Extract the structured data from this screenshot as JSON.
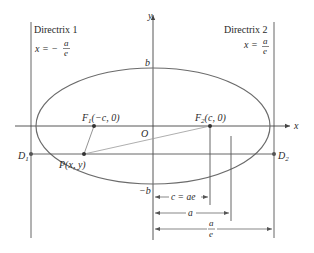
{
  "diagram": {
    "type": "ellipse-directrix",
    "colors": {
      "ellipse": "#6b6b6b",
      "axes": "#444444",
      "lines": "#555555",
      "text": "#2a2a2a"
    },
    "axes": {
      "x_label": "x",
      "y_label": "y",
      "origin_label": "O"
    },
    "ellipse": {
      "top_label": "b",
      "bottom_label": "−b"
    },
    "directrix1": {
      "title": "Directrix 1",
      "eq_lhs": "x = −",
      "eq_num": "a",
      "eq_den": "e"
    },
    "directrix2": {
      "title": "Directrix 2",
      "eq_lhs": "x =",
      "eq_num": "a",
      "eq_den": "e"
    },
    "foci": [
      {
        "name": "F",
        "sub": "1",
        "coords": "(−c, 0)"
      },
      {
        "name": "F",
        "sub": "2",
        "coords": "(c, 0)"
      }
    ],
    "point": {
      "label": "P(x, y)"
    },
    "directrix_points": [
      {
        "name": "D",
        "sub": "1"
      },
      {
        "name": "D",
        "sub": "2"
      }
    ],
    "dimensions": [
      {
        "label": "c = ae"
      },
      {
        "label": "a"
      },
      {
        "num": "a",
        "den": "e"
      }
    ]
  }
}
